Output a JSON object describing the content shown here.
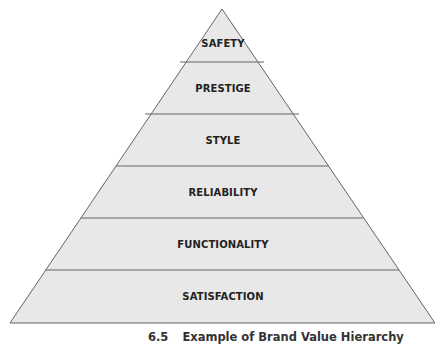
{
  "diagram": {
    "type": "pyramid",
    "levels": [
      {
        "label": "SAFETY"
      },
      {
        "label": "PRESTIGE"
      },
      {
        "label": "STYLE"
      },
      {
        "label": "RELIABILITY"
      },
      {
        "label": "FUNCTIONALITY"
      },
      {
        "label": "SATISFACTION"
      }
    ],
    "fill_color": "#e8e8e8",
    "line_color": "#666666"
  },
  "caption": {
    "number": "6.5",
    "text": "Example of Brand Value Hierarchy"
  }
}
